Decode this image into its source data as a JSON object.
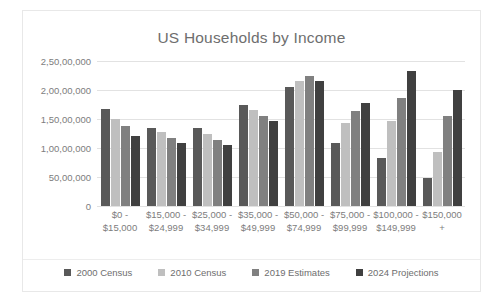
{
  "chart_data": {
    "type": "bar",
    "title": "US Households by Income",
    "xlabel": "",
    "ylabel": "",
    "grid": true,
    "legend_position": "bottom",
    "ylim": [
      0,
      25000000
    ],
    "ytick_values": [
      0,
      5000000,
      10000000,
      15000000,
      20000000,
      25000000
    ],
    "ytick_labels": [
      "0",
      "50,00,000",
      "1,00,00,000",
      "1,50,00,000",
      "2,00,00,000",
      "2,50,00,000"
    ],
    "categories": [
      "$0 -\n$15,000",
      "$15,000 -\n$24,999",
      "$25,000 -\n$34,999",
      "$35,000 -\n$49,999",
      "$50,000 -\n$74,999",
      "$75,000 -\n$99,999",
      "$100,000 -\n$149,999",
      "$150,000\n+"
    ],
    "series": [
      {
        "name": "2000 Census",
        "color": "#595959",
        "values": [
          16700000,
          13500000,
          13500000,
          17500000,
          20500000,
          10800000,
          8200000,
          4900000
        ]
      },
      {
        "name": "2010 Census",
        "color": "#bfbfbf",
        "values": [
          15000000,
          12800000,
          12400000,
          16600000,
          21600000,
          14300000,
          14700000,
          9300000
        ]
      },
      {
        "name": "2019 Estimates",
        "color": "#808080",
        "values": [
          13800000,
          11700000,
          11300000,
          15600000,
          22400000,
          16300000,
          18600000,
          15600000
        ]
      },
      {
        "name": "2024 Projections",
        "color": "#404040",
        "values": [
          12000000,
          10800000,
          10500000,
          14700000,
          21500000,
          17800000,
          23300000,
          20000000
        ]
      }
    ]
  }
}
